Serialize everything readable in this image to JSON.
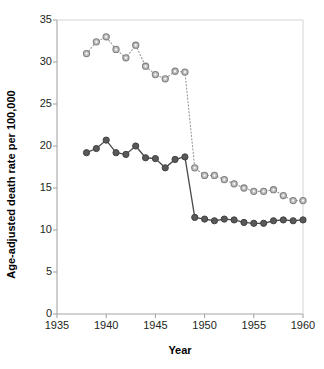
{
  "chart_data": {
    "type": "line",
    "title": "",
    "xlabel": "Year",
    "ylabel": "Age-adjusted death rate per 100,000",
    "xlim": [
      1935,
      1960
    ],
    "ylim": [
      0,
      35
    ],
    "xticks": [
      "1935",
      "1940",
      "1945",
      "1950",
      "1955",
      "1960"
    ],
    "yticks": [
      "0",
      "5",
      "10",
      "15",
      "20",
      "25",
      "30",
      "35"
    ],
    "grid": false,
    "legend": "none",
    "x": [
      1938,
      1939,
      1940,
      1941,
      1942,
      1943,
      1944,
      1945,
      1946,
      1947,
      1948,
      1949,
      1950,
      1951,
      1952,
      1953,
      1954,
      1955,
      1956,
      1957,
      1958,
      1959,
      1960
    ],
    "series": [
      {
        "name": "upper-series",
        "marker": "open-circle",
        "line_style": "dotted",
        "color": "#808080",
        "values": [
          31.0,
          32.4,
          33.0,
          31.5,
          30.5,
          32.0,
          29.5,
          28.5,
          28.0,
          28.9,
          28.8,
          17.4,
          16.5,
          16.5,
          16.0,
          15.5,
          15.0,
          14.6,
          14.6,
          14.8,
          14.1,
          13.5,
          13.5
        ]
      },
      {
        "name": "lower-series",
        "marker": "filled-circle",
        "line_style": "solid",
        "color": "#4d4d4d",
        "values": [
          19.2,
          19.7,
          20.7,
          19.2,
          19.0,
          20.0,
          18.6,
          18.5,
          17.4,
          18.4,
          18.7,
          11.5,
          11.3,
          11.1,
          11.3,
          11.2,
          10.9,
          10.8,
          10.8,
          11.1,
          11.2,
          11.1,
          11.2
        ]
      }
    ]
  },
  "axis": {
    "x_title": "Year",
    "y_title": "Age-adjusted death rate per 100,000"
  },
  "colors": {
    "upper_marker_fill": "#bfbfbf",
    "upper_marker_stroke": "#808080",
    "lower_marker_fill": "#595959",
    "lower_marker_stroke": "#404040",
    "axis": "#a6a6a6",
    "text": "#231f20"
  }
}
